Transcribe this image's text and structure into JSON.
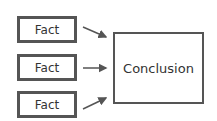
{
  "facts": [
    {
      "label": "Fact"
    },
    {
      "label": "Fact"
    },
    {
      "label": "Fact"
    }
  ],
  "conclusion": {
    "label": "Conclusion"
  },
  "colors": {
    "border": "#555555",
    "text": "#333333",
    "arrow": "#555555"
  }
}
